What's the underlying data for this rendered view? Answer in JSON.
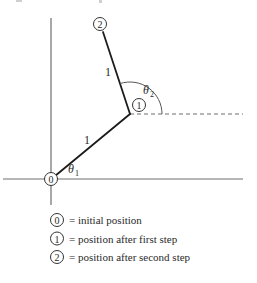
{
  "diagram": {
    "points": [
      {
        "id": "0",
        "label": "0"
      },
      {
        "id": "1",
        "label": "1"
      },
      {
        "id": "2",
        "label": "2"
      }
    ],
    "segments": [
      {
        "from": "0",
        "to": "1",
        "length_label": "1"
      },
      {
        "from": "1",
        "to": "2",
        "length_label": "1"
      }
    ],
    "angles": [
      {
        "id": "theta1",
        "symbol": "θ",
        "subscript": "1"
      },
      {
        "id": "theta2",
        "symbol": "θ",
        "subscript": "2"
      }
    ]
  },
  "legend": {
    "items": [
      {
        "marker": "0",
        "text": "= initial position"
      },
      {
        "marker": "1",
        "text": "= position after first step"
      },
      {
        "marker": "2",
        "text": "= position after second step"
      }
    ]
  }
}
